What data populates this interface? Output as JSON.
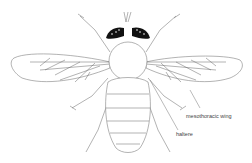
{
  "diagram": {
    "labels": [
      {
        "id": "mesothoracic-wing",
        "text": "mesothoracic wing"
      },
      {
        "id": "haltere",
        "text": "haltere"
      }
    ],
    "colors": {
      "stroke": "#555555",
      "eye": "#111111",
      "background": "#ffffff"
    }
  }
}
